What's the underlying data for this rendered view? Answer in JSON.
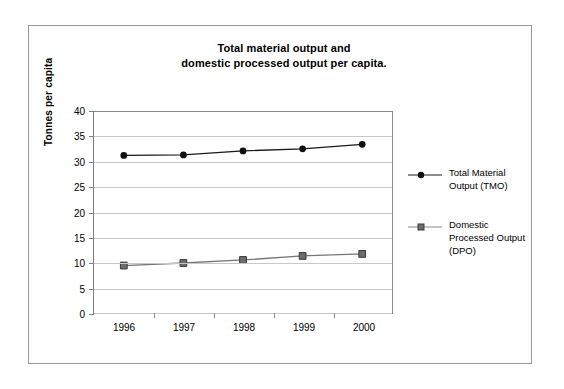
{
  "chart_data": {
    "type": "line",
    "title": "Total material output and domestic processed output per capita.",
    "title_lines": [
      "Total material output and",
      "domestic processed output per capita."
    ],
    "xlabel": "",
    "ylabel": "Tonnes per capita",
    "categories": [
      "1996",
      "1997",
      "1998",
      "1999",
      "2000"
    ],
    "ylim": [
      0,
      40
    ],
    "yticks": [
      0,
      5,
      10,
      15,
      20,
      25,
      30,
      35,
      40
    ],
    "ytick_labels": [
      "0",
      "5",
      "10",
      "15",
      "20",
      "25",
      "30",
      "35",
      "40"
    ],
    "grid": true,
    "legend_position": "right",
    "series": [
      {
        "name": "Total Material Output (TMO)",
        "name_lines": [
          "Total Material",
          "Output (TMO)"
        ],
        "marker": "circle",
        "color": "#1a1a1a",
        "marker_fill": "#111111",
        "values": [
          31.2,
          31.3,
          32.1,
          32.5,
          33.4
        ]
      },
      {
        "name": "Domestic Processed Output (DPO)",
        "name_lines": [
          "Domestic",
          "Processed Output",
          "(DPO)"
        ],
        "marker": "square",
        "color": "#777777",
        "marker_fill": "#6d6d6d",
        "values": [
          9.4,
          9.9,
          10.5,
          11.3,
          11.7
        ]
      }
    ]
  }
}
